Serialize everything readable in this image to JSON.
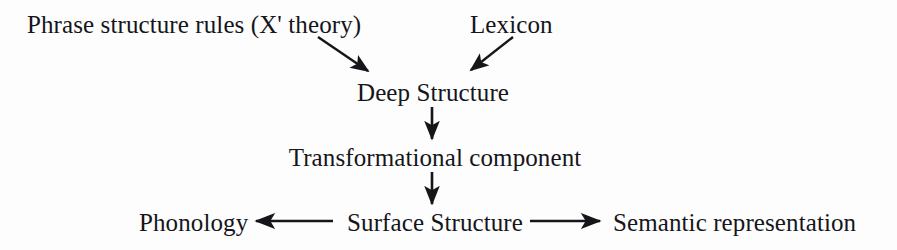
{
  "diagram": {
    "title_text": "",
    "background_color": "#fdfdfd",
    "ink_color": "#15151a",
    "nodes": {
      "phrase_structure_rules": "Phrase structure rules (X' theory)",
      "lexicon": "Lexicon",
      "deep_structure": "Deep Structure",
      "transformational_component": "Transformational component",
      "surface_structure": "Surface Structure",
      "phonology": "Phonology",
      "semantic_representation": "Semantic representation"
    },
    "arrows": [
      {
        "name": "arrow-phrase-structure-to-deep-structure",
        "from": "phrase_structure_rules",
        "to": "deep_structure",
        "direction": "down-right",
        "x1": 318,
        "y1": 37,
        "x2": 370,
        "y2": 73
      },
      {
        "name": "arrow-lexicon-to-deep-structure",
        "from": "lexicon",
        "to": "deep_structure",
        "direction": "down-left",
        "x1": 513,
        "y1": 37,
        "x2": 469,
        "y2": 72
      },
      {
        "name": "arrow-deep-structure-to-transformational-component",
        "from": "deep_structure",
        "to": "transformational_component",
        "direction": "down",
        "x1": 432,
        "y1": 107,
        "x2": 432,
        "y2": 141
      },
      {
        "name": "arrow-transformational-component-to-surface-structure",
        "from": "transformational_component",
        "to": "surface_structure",
        "direction": "down",
        "x1": 432,
        "y1": 172,
        "x2": 432,
        "y2": 206
      },
      {
        "name": "arrow-surface-structure-to-phonology",
        "from": "surface_structure",
        "to": "phonology",
        "direction": "left",
        "x1": 332,
        "y1": 221,
        "x2": 252,
        "y2": 221
      },
      {
        "name": "arrow-surface-structure-to-semantic-representation",
        "from": "surface_structure",
        "to": "semantic_representation",
        "direction": "right",
        "x1": 530,
        "y1": 221,
        "x2": 604,
        "y2": 221
      }
    ]
  }
}
